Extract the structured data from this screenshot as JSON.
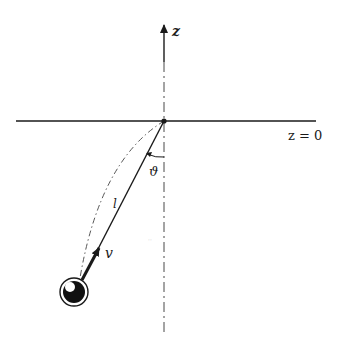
{
  "diagram": {
    "axis": {
      "label": "z"
    },
    "plane": {
      "label": "z = 0"
    },
    "pendulum": {
      "length_label": "l",
      "angle_label": "ϑ",
      "velocity_label": "v"
    },
    "colors": {
      "ink": "#1a1a1a",
      "background": "#ffffff"
    }
  }
}
